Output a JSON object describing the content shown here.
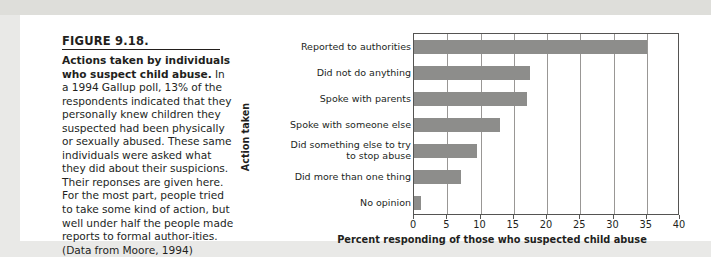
{
  "figure": {
    "number": "FIGURE 9.18.",
    "caption_lead": "Actions taken by individuals who suspect child abuse.",
    "caption_rest": " In a 1994 Gallup poll, 13% of the respondents indicated that they personally knew children they suspected had been physically or sexually abused. These same individuals were asked what they did about their suspicions. Their reponses are given here. For the most part, people tried to take some kind of action, but well under half the people made reports to formal author-ities. (Data from Moore, 1994)"
  },
  "chart_data": {
    "type": "bar",
    "orientation": "horizontal",
    "title": "",
    "xlabel": "Percent responding of those who suspected child abuse",
    "ylabel": "Action taken",
    "categories": [
      "Reported to authorities",
      "Did not do anything",
      "Spoke with parents",
      "Spoke with someone else",
      "Did something else to try\nto stop abuse",
      "Did more than one thing",
      "No opinion"
    ],
    "values": [
      35,
      17.5,
      17,
      13,
      9.5,
      7,
      1
    ],
    "xlim": [
      0,
      40
    ],
    "xticks": [
      0,
      5,
      10,
      15,
      20,
      25,
      30,
      35,
      40
    ],
    "xtick_labels": [
      "0",
      "5",
      "10",
      "15",
      "20",
      "25",
      "30",
      "35",
      "40"
    ],
    "grid": "vertical",
    "legend": "none",
    "bar_color": "#8d8d8b"
  }
}
